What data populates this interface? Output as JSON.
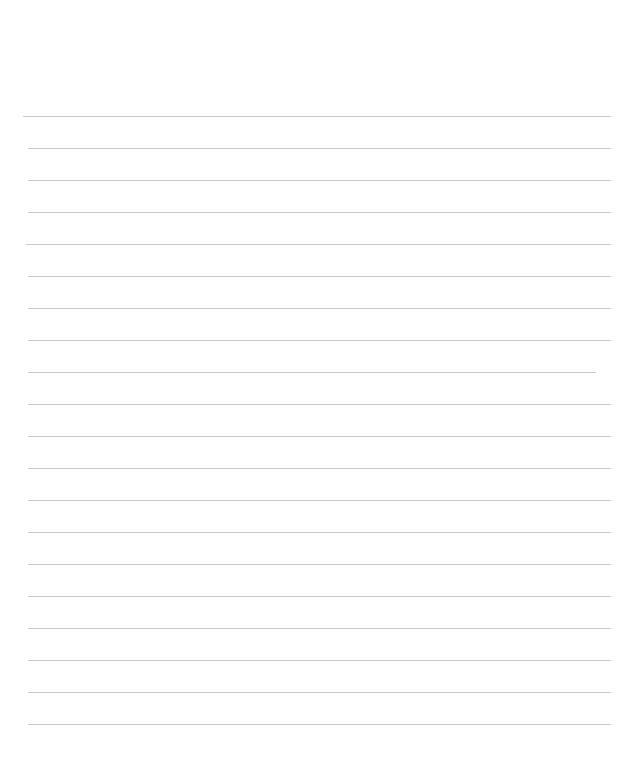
{
  "page": {
    "type": "lined-paper",
    "background": "#fefefe",
    "line_color": "#c9c9c9",
    "lines": [
      {
        "y": 116,
        "x1": 23,
        "x2": 611
      },
      {
        "y": 148,
        "x1": 28,
        "x2": 611
      },
      {
        "y": 180,
        "x1": 28,
        "x2": 611
      },
      {
        "y": 212,
        "x1": 28,
        "x2": 611
      },
      {
        "y": 244,
        "x1": 26,
        "x2": 611
      },
      {
        "y": 276,
        "x1": 28,
        "x2": 611
      },
      {
        "y": 308,
        "x1": 28,
        "x2": 611
      },
      {
        "y": 340,
        "x1": 28,
        "x2": 611
      },
      {
        "y": 372,
        "x1": 28,
        "x2": 596
      },
      {
        "y": 404,
        "x1": 28,
        "x2": 611
      },
      {
        "y": 436,
        "x1": 28,
        "x2": 611
      },
      {
        "y": 468,
        "x1": 28,
        "x2": 611
      },
      {
        "y": 500,
        "x1": 28,
        "x2": 611
      },
      {
        "y": 532,
        "x1": 28,
        "x2": 611
      },
      {
        "y": 564,
        "x1": 28,
        "x2": 611
      },
      {
        "y": 596,
        "x1": 28,
        "x2": 611
      },
      {
        "y": 628,
        "x1": 28,
        "x2": 611
      },
      {
        "y": 660,
        "x1": 28,
        "x2": 611
      },
      {
        "y": 692,
        "x1": 28,
        "x2": 611
      },
      {
        "y": 724,
        "x1": 28,
        "x2": 611
      }
    ]
  }
}
